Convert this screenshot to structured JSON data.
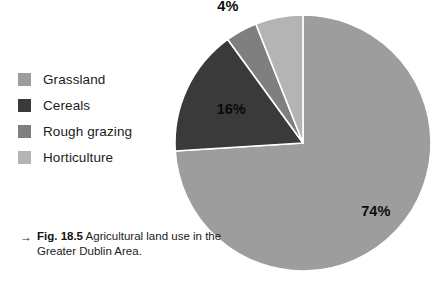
{
  "figure": {
    "caption_arrow": "→",
    "caption_label": "Fig. 18.5",
    "caption_text": "Agricultural land use in the Greater Dublin Area."
  },
  "legend": {
    "items": [
      {
        "label": "Grassland",
        "color": "#9d9d9d"
      },
      {
        "label": "Cereals",
        "color": "#3a3a3a"
      },
      {
        "label": "Rough grazing",
        "color": "#7f7f7f"
      },
      {
        "label": "Horticulture",
        "color": "#b4b4b4"
      }
    ]
  },
  "chart_data": {
    "type": "pie",
    "title": "Agricultural land use in the Greater Dublin Area",
    "xlabel": "",
    "ylabel": "",
    "unit": "percent",
    "legend_position": "left",
    "grid": false,
    "start_angle_deg": 0,
    "direction": "clockwise",
    "separator_color": "#ffffff",
    "categories": [
      "Grassland",
      "Cereals",
      "Rough grazing",
      "Horticulture"
    ],
    "values": [
      74,
      16,
      4,
      6
    ],
    "labels": [
      "74%",
      "16%",
      "4%",
      "6%"
    ],
    "colors": [
      "#9d9d9d",
      "#3a3a3a",
      "#7f7f7f",
      "#b4b4b4"
    ],
    "slices": [
      {
        "name": "Grassland",
        "value": 74,
        "label": "74%",
        "color": "#9d9d9d"
      },
      {
        "name": "Cereals",
        "value": 16,
        "label": "16%",
        "color": "#3a3a3a"
      },
      {
        "name": "Rough grazing",
        "value": 4,
        "label": "4%",
        "color": "#7f7f7f"
      },
      {
        "name": "Horticulture",
        "value": 6,
        "label": "6%",
        "color": "#b4b4b4"
      }
    ]
  }
}
